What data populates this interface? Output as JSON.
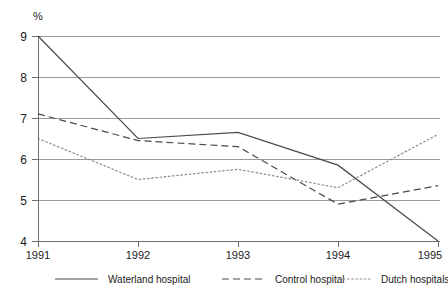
{
  "chart_data": {
    "type": "line",
    "title": "",
    "xlabel": "",
    "ylabel": "%",
    "categories": [
      "1991",
      "1992",
      "1993",
      "1994",
      "1995"
    ],
    "x": [
      1991,
      1992,
      1993,
      1994,
      1995
    ],
    "xlim": [
      1991,
      1995
    ],
    "ylim": [
      4,
      9
    ],
    "yticks": [
      4,
      5,
      6,
      7,
      8,
      9
    ],
    "ytick_labels": [
      "4",
      "5",
      "6",
      "7",
      "8",
      "9"
    ],
    "xtick_labels": [
      "1991",
      "1992",
      "1993",
      "1994",
      "1995"
    ],
    "grid": true,
    "grid_axis": "y",
    "legend_position": "bottom",
    "series": [
      {
        "name": "Waterland hospital",
        "style": "solid",
        "color": "#4a4a4a",
        "values": [
          9.0,
          6.5,
          6.65,
          5.85,
          4.0
        ]
      },
      {
        "name": "Control hospital",
        "style": "dashed",
        "color": "#4a4a4a",
        "values": [
          7.1,
          6.45,
          6.3,
          4.9,
          5.35
        ]
      },
      {
        "name": "Dutch hospitals",
        "style": "dotted",
        "color": "#8c8c8c",
        "values": [
          6.5,
          5.5,
          5.75,
          5.3,
          6.6
        ]
      }
    ]
  },
  "axis": {
    "unit_label": "%"
  },
  "legend": {
    "items": [
      {
        "label": "Waterland hospital"
      },
      {
        "label": "Control hospital"
      },
      {
        "label": "Dutch hospitals"
      }
    ]
  }
}
